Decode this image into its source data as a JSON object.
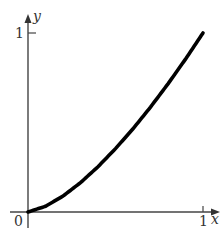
{
  "chart_data": {
    "type": "line",
    "title": "",
    "xlabel": "x",
    "ylabel": "y",
    "xlim": [
      0,
      1
    ],
    "ylim": [
      0,
      1
    ],
    "grid": false,
    "legend": null,
    "x_ticks": [
      "0",
      "1"
    ],
    "y_ticks": [
      "1"
    ],
    "series": [
      {
        "name": "y = x^1.5",
        "x": [
          0,
          0.1,
          0.2,
          0.3,
          0.4,
          0.5,
          0.6,
          0.7,
          0.8,
          0.9,
          1.0
        ],
        "y": [
          0,
          0.032,
          0.089,
          0.164,
          0.253,
          0.354,
          0.465,
          0.586,
          0.716,
          0.854,
          1.0
        ]
      }
    ]
  },
  "labels": {
    "origin": "0",
    "x_tick_1": "1",
    "y_tick_1": "1",
    "x_axis": "x",
    "y_axis": "y"
  }
}
